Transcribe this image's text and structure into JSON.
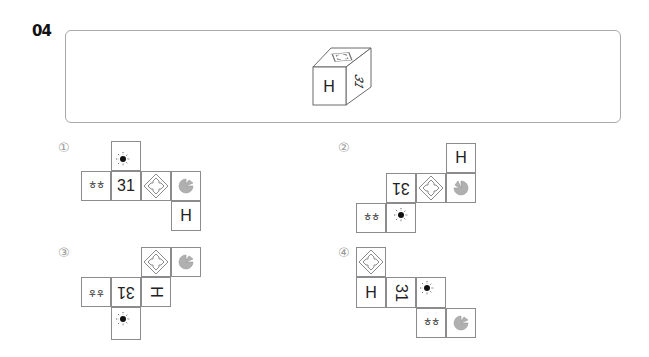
{
  "question": {
    "number": "04",
    "cube": {
      "front_face": "H",
      "right_face": "31",
      "top_face": "arrows-diamond-icon"
    }
  },
  "options": [
    {
      "label": "①",
      "cells": [
        {
          "face": "sun-icon"
        },
        {
          "face": "hh-text",
          "text": "ㅎㅎ"
        },
        {
          "face": "text",
          "text": "31"
        },
        {
          "face": "arrows-diamond-icon"
        },
        {
          "face": "pie-icon"
        },
        {
          "face": "text",
          "text": "H"
        }
      ]
    },
    {
      "label": "②",
      "cells": [
        {
          "face": "text",
          "text": "H"
        },
        {
          "face": "text",
          "text": "31",
          "rotation": "180"
        },
        {
          "face": "arrows-diamond-icon"
        },
        {
          "face": "pie-icon"
        },
        {
          "face": "hh-text",
          "text": "ㅎㅎ"
        },
        {
          "face": "sun-icon"
        }
      ]
    },
    {
      "label": "③",
      "cells": [
        {
          "face": "arrows-diamond-icon"
        },
        {
          "face": "pie-icon"
        },
        {
          "face": "hh-text",
          "text": "ㅎㅎ",
          "rotation": "180"
        },
        {
          "face": "text",
          "text": "31",
          "rotation": "180"
        },
        {
          "face": "text",
          "text": "H",
          "rotation": "90"
        },
        {
          "face": "sun-icon"
        }
      ]
    },
    {
      "label": "④",
      "cells": [
        {
          "face": "arrows-diamond-icon"
        },
        {
          "face": "text",
          "text": "H"
        },
        {
          "face": "text",
          "text": "31",
          "rotation": "90"
        },
        {
          "face": "sun-icon"
        },
        {
          "face": "hh-text",
          "text": "ㅎㅎ"
        },
        {
          "face": "pie-icon"
        }
      ]
    }
  ],
  "colors": {
    "border": "#8c8c8c",
    "pie_fill": "#b0b0b0",
    "label_gray": "#9a9a9a"
  }
}
